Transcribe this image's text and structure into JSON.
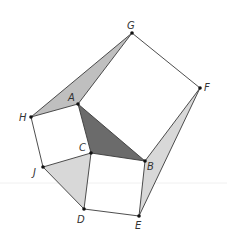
{
  "diagram": {
    "width": 227,
    "height": 243,
    "background": "#ffffff",
    "points": {
      "A": {
        "x": 78,
        "y": 104,
        "label": "A",
        "lx": 68,
        "ly": 101
      },
      "B": {
        "x": 145,
        "y": 161,
        "label": "B",
        "lx": 147,
        "ly": 170
      },
      "C": {
        "x": 91,
        "y": 153,
        "label": "C",
        "lx": 79,
        "ly": 151
      },
      "D": {
        "x": 84,
        "y": 209,
        "label": "D",
        "lx": 77,
        "ly": 223
      },
      "E": {
        "x": 139,
        "y": 216,
        "label": "E",
        "lx": 135,
        "ly": 229
      },
      "F": {
        "x": 200,
        "y": 88,
        "label": "F",
        "lx": 204,
        "ly": 91
      },
      "G": {
        "x": 132,
        "y": 33,
        "label": "G",
        "lx": 127,
        "ly": 29
      },
      "H": {
        "x": 31,
        "y": 117,
        "label": "H",
        "lx": 19,
        "ly": 121
      },
      "J": {
        "x": 43,
        "y": 167,
        "label": "J",
        "lx": 33,
        "ly": 176
      }
    },
    "shaded_regions": [
      {
        "name": "triangle-ACB",
        "vertices": [
          "A",
          "C",
          "B"
        ],
        "fill": "#6b6b6b"
      },
      {
        "name": "triangle-HAG",
        "vertices": [
          "H",
          "A",
          "G"
        ],
        "fill": "#bfbfbf"
      },
      {
        "name": "triangle-BFE",
        "vertices": [
          "B",
          "F",
          "E"
        ],
        "fill": "#d8d8d8"
      },
      {
        "name": "triangle-JCD",
        "vertices": [
          "J",
          "C",
          "D"
        ],
        "fill": "#d8d8d8"
      }
    ],
    "squares": [
      {
        "name": "square-ABFG",
        "vertices": [
          "A",
          "B",
          "F",
          "G"
        ]
      },
      {
        "name": "square-HACJ",
        "vertices": [
          "H",
          "A",
          "C",
          "J"
        ]
      },
      {
        "name": "square-CBED",
        "vertices": [
          "C",
          "B",
          "E",
          "D"
        ]
      }
    ],
    "segments": [
      [
        "A",
        "B"
      ],
      [
        "B",
        "F"
      ],
      [
        "F",
        "G"
      ],
      [
        "G",
        "A"
      ],
      [
        "H",
        "A"
      ],
      [
        "A",
        "C"
      ],
      [
        "C",
        "J"
      ],
      [
        "J",
        "H"
      ],
      [
        "C",
        "B"
      ],
      [
        "B",
        "E"
      ],
      [
        "E",
        "D"
      ],
      [
        "D",
        "C"
      ],
      [
        "H",
        "G"
      ],
      [
        "F",
        "E"
      ],
      [
        "J",
        "D"
      ]
    ],
    "guide_line": {
      "y": 183,
      "x1": 0,
      "x2": 227,
      "color": "#f0f0f0"
    }
  }
}
